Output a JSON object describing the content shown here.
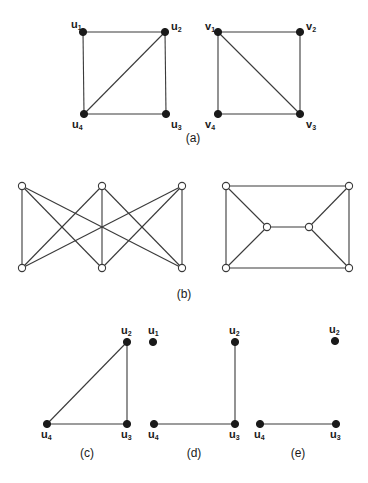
{
  "figure": {
    "panels": [
      {
        "id": "a-left",
        "caption": null,
        "node_style": "filled",
        "nodes": [
          {
            "id": "u1",
            "letter": "u",
            "sub": "1",
            "x": 83,
            "y": 32,
            "lx": 71,
            "ly": 28
          },
          {
            "id": "u2",
            "letter": "u",
            "sub": "2",
            "x": 165,
            "y": 32,
            "lx": 171,
            "ly": 30
          },
          {
            "id": "u3",
            "letter": "u",
            "sub": "3",
            "x": 166,
            "y": 114,
            "lx": 171,
            "ly": 128
          },
          {
            "id": "u4",
            "letter": "u",
            "sub": "4",
            "x": 84,
            "y": 114,
            "lx": 72,
            "ly": 128
          }
        ],
        "edges": [
          [
            "u1",
            "u2"
          ],
          [
            "u2",
            "u3"
          ],
          [
            "u3",
            "u4"
          ],
          [
            "u4",
            "u1"
          ],
          [
            "u4",
            "u2"
          ]
        ]
      },
      {
        "id": "a-right",
        "caption": null,
        "node_style": "filled",
        "nodes": [
          {
            "id": "v1",
            "letter": "v",
            "sub": "1",
            "x": 218,
            "y": 32,
            "lx": 205,
            "ly": 30
          },
          {
            "id": "v2",
            "letter": "v",
            "sub": "2",
            "x": 300,
            "y": 32,
            "lx": 306,
            "ly": 30
          },
          {
            "id": "v3",
            "letter": "v",
            "sub": "3",
            "x": 300,
            "y": 114,
            "lx": 306,
            "ly": 128
          },
          {
            "id": "v4",
            "letter": "v",
            "sub": "4",
            "x": 218,
            "y": 114,
            "lx": 205,
            "ly": 128
          }
        ],
        "edges": [
          [
            "v1",
            "v2"
          ],
          [
            "v2",
            "v3"
          ],
          [
            "v3",
            "v4"
          ],
          [
            "v4",
            "v1"
          ],
          [
            "v1",
            "v3"
          ]
        ]
      },
      {
        "id": "b-left",
        "caption": null,
        "node_style": "open",
        "nodes": [
          {
            "id": "t1",
            "x": 22,
            "y": 186
          },
          {
            "id": "t2",
            "x": 102,
            "y": 186
          },
          {
            "id": "t3",
            "x": 182,
            "y": 186
          },
          {
            "id": "b1",
            "x": 22,
            "y": 268
          },
          {
            "id": "b2",
            "x": 102,
            "y": 268
          },
          {
            "id": "b3",
            "x": 182,
            "y": 268
          }
        ],
        "edges": [
          [
            "t1",
            "b1"
          ],
          [
            "t1",
            "b2"
          ],
          [
            "t1",
            "b3"
          ],
          [
            "t2",
            "b1"
          ],
          [
            "t2",
            "b2"
          ],
          [
            "t2",
            "b3"
          ],
          [
            "t3",
            "b1"
          ],
          [
            "t3",
            "b2"
          ],
          [
            "t3",
            "b3"
          ]
        ]
      },
      {
        "id": "b-right",
        "caption": null,
        "node_style": "open",
        "nodes": [
          {
            "id": "tl",
            "x": 226,
            "y": 186
          },
          {
            "id": "tr",
            "x": 349,
            "y": 186
          },
          {
            "id": "bl",
            "x": 226,
            "y": 268
          },
          {
            "id": "br",
            "x": 349,
            "y": 268
          },
          {
            "id": "ml",
            "x": 267,
            "y": 227
          },
          {
            "id": "mr",
            "x": 309,
            "y": 227
          }
        ],
        "edges": [
          [
            "tl",
            "tr"
          ],
          [
            "tr",
            "br"
          ],
          [
            "br",
            "bl"
          ],
          [
            "bl",
            "tl"
          ],
          [
            "tl",
            "ml"
          ],
          [
            "bl",
            "ml"
          ],
          [
            "ml",
            "mr"
          ],
          [
            "mr",
            "tr"
          ],
          [
            "mr",
            "br"
          ]
        ]
      },
      {
        "id": "c",
        "caption": null,
        "node_style": "filled",
        "nodes": [
          {
            "id": "u2",
            "letter": "u",
            "sub": "2",
            "x": 127,
            "y": 342,
            "lx": 121,
            "ly": 334
          },
          {
            "id": "u3",
            "letter": "u",
            "sub": "3",
            "x": 127,
            "y": 424,
            "lx": 121,
            "ly": 438
          },
          {
            "id": "u4",
            "letter": "u",
            "sub": "4",
            "x": 47,
            "y": 424,
            "lx": 41,
            "ly": 438
          }
        ],
        "edges": [
          [
            "u2",
            "u3"
          ],
          [
            "u3",
            "u4"
          ],
          [
            "u4",
            "u2"
          ]
        ]
      },
      {
        "id": "d",
        "caption": null,
        "node_style": "filled",
        "nodes": [
          {
            "id": "u1",
            "letter": "u",
            "sub": "1",
            "x": 153,
            "y": 342,
            "lx": 148,
            "ly": 334
          },
          {
            "id": "u2",
            "letter": "u",
            "sub": "2",
            "x": 235,
            "y": 342,
            "lx": 229,
            "ly": 334
          },
          {
            "id": "u3",
            "letter": "u",
            "sub": "3",
            "x": 235,
            "y": 424,
            "lx": 229,
            "ly": 438
          },
          {
            "id": "u4",
            "letter": "u",
            "sub": "4",
            "x": 154,
            "y": 424,
            "lx": 148,
            "ly": 438
          }
        ],
        "edges": [
          [
            "u2",
            "u3"
          ],
          [
            "u3",
            "u4"
          ]
        ]
      },
      {
        "id": "e",
        "caption": null,
        "node_style": "filled",
        "nodes": [
          {
            "id": "u2",
            "letter": "u",
            "sub": "2",
            "x": 335,
            "y": 341,
            "lx": 329,
            "ly": 333
          },
          {
            "id": "u3",
            "letter": "u",
            "sub": "3",
            "x": 336,
            "y": 424,
            "lx": 330,
            "ly": 438
          },
          {
            "id": "u4",
            "letter": "u",
            "sub": "4",
            "x": 260,
            "y": 424,
            "lx": 254,
            "ly": 438
          }
        ],
        "edges": [
          [
            "u3",
            "u4"
          ]
        ]
      }
    ],
    "captions": [
      {
        "id": "a",
        "text": "(a)",
        "x": 193,
        "y": 142
      },
      {
        "id": "b",
        "text": "(b)",
        "x": 184,
        "y": 298
      },
      {
        "id": "c",
        "text": "(c)",
        "x": 87,
        "y": 457
      },
      {
        "id": "d",
        "text": "(d)",
        "x": 194,
        "y": 457
      },
      {
        "id": "e",
        "text": "(e)",
        "x": 298,
        "y": 457
      }
    ],
    "colors": {
      "ink": "#1a1a1a",
      "edge": "#3a3a3a",
      "background": "#ffffff"
    }
  }
}
